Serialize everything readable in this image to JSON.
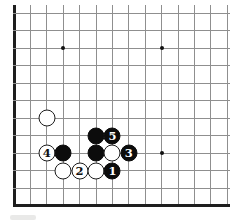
{
  "diagram": {
    "background": "#ffffff",
    "board": {
      "cols": 14,
      "rows": 12,
      "origin_x": 14,
      "origin_y": 13,
      "spacing_x": 16.4,
      "spacing_y": 17.5,
      "thin_line_color": "#8f8f8f",
      "edge_line_color": "#1e1e1e",
      "thick_left_edge": true,
      "thick_bottom_edge": true,
      "top_overhang_px": 8,
      "right_overhang_px": 2
    },
    "star_points": [
      {
        "col": 3,
        "row": 2
      },
      {
        "col": 9,
        "row": 2
      },
      {
        "col": 9,
        "row": 8
      }
    ],
    "stones": [
      {
        "col": 2,
        "row": 6,
        "color": "white",
        "label": ""
      },
      {
        "col": 2,
        "row": 8,
        "color": "white",
        "label": "4"
      },
      {
        "col": 3,
        "row": 8,
        "color": "black",
        "label": ""
      },
      {
        "col": 5,
        "row": 7,
        "color": "black",
        "label": ""
      },
      {
        "col": 6,
        "row": 7,
        "color": "black",
        "label": "5"
      },
      {
        "col": 5,
        "row": 8,
        "color": "black",
        "label": ""
      },
      {
        "col": 6,
        "row": 8,
        "color": "white",
        "label": ""
      },
      {
        "col": 7,
        "row": 8,
        "color": "black",
        "label": "3"
      },
      {
        "col": 3,
        "row": 9,
        "color": "white",
        "label": ""
      },
      {
        "col": 4,
        "row": 9,
        "color": "white",
        "label": "2"
      },
      {
        "col": 5,
        "row": 9,
        "color": "white",
        "label": ""
      },
      {
        "col": 6,
        "row": 9,
        "color": "black",
        "label": "1"
      }
    ],
    "stone_colors": {
      "black_fill": "#0c0c0c",
      "white_fill": "#ffffff",
      "white_border": "#1c1c1c",
      "black_label_text": "#ffffff",
      "white_label_text": "#111111"
    }
  }
}
